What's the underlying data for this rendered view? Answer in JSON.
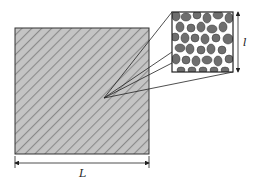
{
  "diagram": {
    "type": "scale-separation schematic",
    "macro_region": {
      "description": "homogenized macroscopic domain (hatched square)",
      "fill": "#bdbdbd",
      "hatch_color": "#7a7a7a",
      "border_color": "#333333"
    },
    "micro_inset": {
      "description": "magnified microstructure with dark grains in white matrix",
      "grain_fill": "#6e6e6e",
      "matrix_fill": "#ffffff",
      "border_color": "#222222"
    },
    "labels": {
      "macro_length": "L",
      "micro_length": "l"
    },
    "dimension_arrows": {
      "horizontal": "spans width of macro square, labeled L",
      "vertical": "spans height of inset, labeled l"
    }
  }
}
